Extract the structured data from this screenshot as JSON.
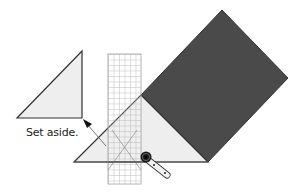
{
  "diagram": {
    "caption": "Set aside.",
    "colors": {
      "background": "#ffffff",
      "dark_fabric": "#4a4a4a",
      "light_fabric": "#eeeeee",
      "outline": "#333333",
      "ruler_grid": "#9a9a9a",
      "cutter_blade": "#1a1a1a",
      "cutter_handle": "#f2f2f2"
    },
    "shapes": {
      "set_aside_triangle": [
        [
          82,
          51
        ],
        [
          17,
          118
        ],
        [
          82,
          118
        ]
      ],
      "dark_square": [
        [
          222,
          10
        ],
        [
          288,
          78
        ],
        [
          208,
          162
        ],
        [
          141,
          95
        ]
      ],
      "light_triangle": [
        [
          141,
          95
        ],
        [
          208,
          162
        ],
        [
          74,
          162
        ]
      ],
      "ruler": {
        "x": 108,
        "y": 54,
        "width": 33,
        "height": 130,
        "columns": 6,
        "cell": 5.5
      },
      "arrow": {
        "from": [
          104,
          145
        ],
        "to": [
          84,
          121
        ]
      },
      "rotary_cutter": {
        "blade_center": [
          146,
          157
        ],
        "handle_end": [
          168,
          176
        ]
      }
    }
  }
}
